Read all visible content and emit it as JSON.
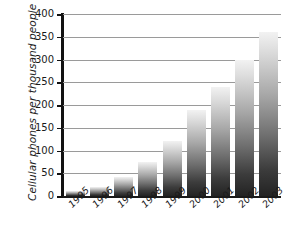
{
  "chart_data": {
    "type": "bar",
    "title": "",
    "xlabel": "",
    "ylabel": "Cellular phones per thousand people",
    "categories": [
      "1995",
      "1996",
      "1997",
      "1998",
      "1999",
      "2000",
      "2001",
      "2002",
      "2003"
    ],
    "values": [
      10,
      20,
      42,
      75,
      120,
      190,
      240,
      300,
      360
    ],
    "ylim": [
      0,
      400
    ],
    "yticks": [
      0,
      50,
      100,
      150,
      200,
      250,
      300,
      350,
      400
    ],
    "ytick_labels": [
      "0",
      "50",
      "100",
      "150",
      "200",
      "250",
      "300",
      "350",
      "400"
    ],
    "grid": true,
    "legend": false,
    "series": [
      {
        "name": "Cellular phones per thousand people",
        "values": [
          10,
          20,
          42,
          75,
          120,
          190,
          240,
          300,
          360
        ]
      }
    ],
    "colors": {
      "bar_top": "#f2f2f2",
      "bar_bottom": "#232323",
      "gridline": "#9a9a9a",
      "axis": "#121212",
      "background": "#ffffff",
      "text": "#1a1a1a"
    }
  }
}
